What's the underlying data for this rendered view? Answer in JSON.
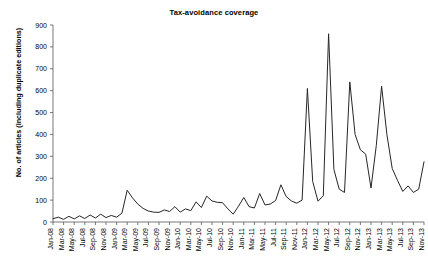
{
  "chart_data": {
    "type": "line",
    "title": "Tax-avoidance coverage",
    "xlabel": "",
    "ylabel": "No. of articles (including duplicate editions)",
    "ylim": [
      0,
      900
    ],
    "ytick_values": [
      0,
      100,
      200,
      300,
      400,
      500,
      600,
      700,
      800,
      900
    ],
    "grid": false,
    "legend": null,
    "line_color": "#262626",
    "x_tick_labels": [
      "Jan-08",
      "Mar-08",
      "May-08",
      "Jul-08",
      "Sep-08",
      "Nov-08",
      "Jan-09",
      "Mar-09",
      "May-09",
      "Jul-09",
      "Sep-09",
      "Nov-09",
      "Jan-10",
      "Mar-10",
      "May-10",
      "Jul-10",
      "Sep-10",
      "Nov-10",
      "Jan-11",
      "Mar-11",
      "May-11",
      "Jul-11",
      "Sep-11",
      "Nov-11",
      "Jan-12",
      "Mar-12",
      "May-12",
      "Jul-12",
      "Sep-12",
      "Nov-12",
      "Jan-13",
      "Mar-13",
      "May-13",
      "Jul-13",
      "Sep-13",
      "Nov-13"
    ],
    "x": [
      "Jan-08",
      "Feb-08",
      "Mar-08",
      "Apr-08",
      "May-08",
      "Jun-08",
      "Jul-08",
      "Aug-08",
      "Sep-08",
      "Oct-08",
      "Nov-08",
      "Dec-08",
      "Jan-09",
      "Feb-09",
      "Mar-09",
      "Apr-09",
      "May-09",
      "Jun-09",
      "Jul-09",
      "Aug-09",
      "Sep-09",
      "Oct-09",
      "Nov-09",
      "Dec-09",
      "Jan-10",
      "Feb-10",
      "Mar-10",
      "Apr-10",
      "May-10",
      "Jun-10",
      "Jul-10",
      "Aug-10",
      "Sep-10",
      "Oct-10",
      "Nov-10",
      "Dec-10",
      "Jan-11",
      "Feb-11",
      "Mar-11",
      "Apr-11",
      "May-11",
      "Jun-11",
      "Jul-11",
      "Aug-11",
      "Sep-11",
      "Oct-11",
      "Nov-11",
      "Dec-11",
      "Jan-12",
      "Feb-12",
      "Mar-12",
      "Apr-12",
      "May-12",
      "Jun-12",
      "Jul-12",
      "Aug-12",
      "Sep-12",
      "Oct-12",
      "Nov-12",
      "Dec-12",
      "Jan-13",
      "Feb-13",
      "Mar-13",
      "Apr-13",
      "May-13",
      "Jun-13",
      "Jul-13",
      "Aug-13",
      "Sep-13",
      "Oct-13",
      "Nov-13"
    ],
    "values": [
      15,
      22,
      12,
      26,
      14,
      28,
      16,
      32,
      18,
      36,
      20,
      30,
      22,
      40,
      145,
      110,
      82,
      62,
      50,
      45,
      44,
      55,
      48,
      70,
      45,
      60,
      52,
      92,
      66,
      118,
      96,
      90,
      88,
      60,
      36,
      72,
      112,
      70,
      64,
      130,
      78,
      82,
      98,
      170,
      116,
      96,
      86,
      100,
      610,
      185,
      95,
      120,
      860,
      240,
      150,
      135,
      640,
      400,
      330,
      310,
      155,
      350,
      620,
      400,
      245,
      190,
      140,
      165,
      135,
      150,
      275
    ]
  }
}
